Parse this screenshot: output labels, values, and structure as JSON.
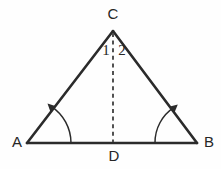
{
  "figure": {
    "kind": "geometry-diagram",
    "background_color": "#fefefe",
    "stroke_color": "#2b2b2b",
    "dash_color": "#4a4a4a",
    "width": 221,
    "height": 169
  },
  "labels": {
    "apex": "C",
    "left_vertex": "A",
    "right_vertex": "B",
    "foot": "D",
    "angle_left": "1",
    "angle_right": "2"
  },
  "points": {
    "C": {
      "x": 113,
      "y": 31
    },
    "A": {
      "x": 27,
      "y": 143
    },
    "B": {
      "x": 197,
      "y": 143
    },
    "D": {
      "x": 113,
      "y": 143
    }
  },
  "label_positions": {
    "C": {
      "x": 113,
      "y": 15
    },
    "A": {
      "x": 17,
      "y": 143
    },
    "B": {
      "x": 209,
      "y": 143
    },
    "D": {
      "x": 114,
      "y": 157
    },
    "angle_left": {
      "x": 106,
      "y": 52
    },
    "angle_right": {
      "x": 122,
      "y": 52
    }
  },
  "segments": [
    {
      "name": "side-AC",
      "from": "A",
      "to": "C",
      "style": "solid"
    },
    {
      "name": "side-CB",
      "from": "C",
      "to": "B",
      "style": "solid"
    },
    {
      "name": "base-AB",
      "from": "A",
      "to": "B",
      "style": "solid"
    },
    {
      "name": "median-CD",
      "from": "C",
      "to": "D",
      "style": "dashed"
    }
  ],
  "angle_marks": [
    {
      "name": "angle-mark-A",
      "vertex": "A",
      "radius": 44,
      "has_arrowhead": true
    },
    {
      "name": "angle-mark-B",
      "vertex": "B",
      "radius": 42,
      "has_arrowhead": true
    }
  ]
}
